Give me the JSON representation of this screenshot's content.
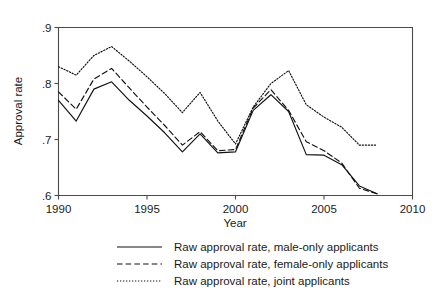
{
  "chart_data": {
    "type": "line",
    "title": "",
    "subtitle": "",
    "xlabel": "Year",
    "ylabel": "Approval rate",
    "xlim": [
      1990,
      2010
    ],
    "ylim": [
      0.6,
      0.9
    ],
    "grid": false,
    "legend_position": "below",
    "xticks": [
      "1990",
      "1995",
      "2000",
      "2005",
      "2010"
    ],
    "xtick_values": [
      1990,
      1995,
      2000,
      2005,
      2010
    ],
    "yticks": [
      ".6",
      ".7",
      ".8",
      ".9"
    ],
    "ytick_values": [
      0.6,
      0.7,
      0.8,
      0.9
    ],
    "x": [
      1990,
      1991,
      1992,
      1993,
      1994,
      1995,
      1996,
      1997,
      1998,
      1999,
      2000,
      2001,
      2002,
      2003,
      2004,
      2005,
      2006,
      2007,
      2008
    ],
    "series": [
      {
        "name": "Raw approval rate, male-only applicants",
        "style": "solid",
        "values": [
          0.77,
          0.733,
          0.79,
          0.803,
          0.77,
          0.742,
          0.712,
          0.678,
          0.71,
          0.676,
          0.678,
          0.752,
          0.78,
          0.75,
          0.673,
          0.672,
          0.655,
          0.617,
          0.603
        ]
      },
      {
        "name": "Raw approval rate, female-only applicants",
        "style": "dashed",
        "values": [
          0.785,
          0.754,
          0.808,
          0.827,
          0.792,
          0.758,
          0.725,
          0.69,
          0.714,
          0.68,
          0.682,
          0.756,
          0.789,
          0.752,
          0.696,
          0.68,
          0.658,
          0.613,
          0.603
        ]
      },
      {
        "name": "Raw approval rate, joint applicants",
        "style": "dotted",
        "values": [
          0.83,
          0.815,
          0.85,
          0.866,
          0.84,
          0.812,
          0.782,
          0.748,
          0.784,
          0.733,
          0.692,
          0.758,
          0.8,
          0.823,
          0.762,
          0.74,
          0.722,
          0.69,
          0.69
        ]
      }
    ],
    "colors": {
      "line": "#111111",
      "axis": "#4a4a4a",
      "text": "#1a1a1a",
      "background": "#ffffff"
    }
  },
  "legend": {
    "entries": [
      {
        "label": "Raw approval rate, male-only applicants",
        "style": "solid"
      },
      {
        "label": "Raw approval rate, female-only applicants",
        "style": "dashed"
      },
      {
        "label": "Raw approval rate, joint applicants",
        "style": "dotted"
      }
    ]
  },
  "axes": {
    "x_title": "Year",
    "y_title": "Approval rate"
  }
}
